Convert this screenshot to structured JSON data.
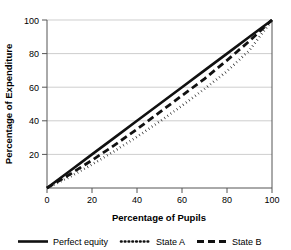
{
  "chart_data": {
    "type": "line",
    "title": "",
    "xlabel": "Percentage of Pupils",
    "ylabel": "Percentage of Expenditure",
    "xlim": [
      0,
      100
    ],
    "ylim": [
      0,
      100
    ],
    "xticks": [
      "0",
      "20",
      "40",
      "60",
      "80",
      "100"
    ],
    "yticks": [
      "0",
      "20",
      "40",
      "60",
      "80",
      "100"
    ],
    "grid": "horizontal",
    "legend_position": "below",
    "x": [
      0,
      10,
      20,
      30,
      40,
      50,
      60,
      70,
      80,
      90,
      100
    ],
    "series": [
      {
        "name": "Perfect equity",
        "style": "solid",
        "color": "#111111",
        "values": [
          0,
          10,
          20,
          30,
          40,
          50,
          60,
          70,
          80,
          90,
          100
        ]
      },
      {
        "name": "State A",
        "style": "dotted",
        "color": "#111111",
        "values": [
          0,
          6.5,
          14,
          22,
          30.5,
          39.5,
          49,
          59,
          69.5,
          82,
          100
        ]
      },
      {
        "name": "State B",
        "style": "dashed",
        "color": "#111111",
        "values": [
          0,
          8,
          16.5,
          25.5,
          35,
          45,
          55,
          65,
          76,
          87.5,
          100
        ]
      }
    ]
  },
  "axis": {
    "x_title": "Percentage of Pupils",
    "y_title": "Percentage of Expenditure",
    "x_ticks": [
      {
        "label": "0",
        "value": 0
      },
      {
        "label": "20",
        "value": 20
      },
      {
        "label": "40",
        "value": 40
      },
      {
        "label": "60",
        "value": 60
      },
      {
        "label": "80",
        "value": 80
      },
      {
        "label": "100",
        "value": 100
      }
    ],
    "y_ticks": [
      {
        "label": "0",
        "value": 0
      },
      {
        "label": "20",
        "value": 20
      },
      {
        "label": "40",
        "value": 40
      },
      {
        "label": "60",
        "value": 60
      },
      {
        "label": "80",
        "value": 80
      },
      {
        "label": "100",
        "value": 100
      }
    ]
  },
  "legend": {
    "items": [
      {
        "label": "Perfect equity",
        "style": "solid"
      },
      {
        "label": "State A",
        "style": "dotted"
      },
      {
        "label": "State B",
        "style": "dashed"
      }
    ]
  },
  "colors": {
    "series": "#111111",
    "grid": "#b9b9b9",
    "axis": "#555555",
    "background": "#ffffff"
  }
}
